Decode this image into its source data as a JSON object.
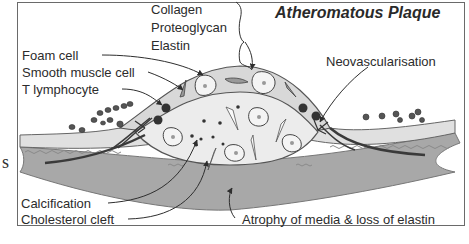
{
  "diagram": {
    "title": "Atheromatous Plaque",
    "side_fragment": "s",
    "labels": {
      "matrix": [
        "Collagen",
        "Proteoglycan",
        "Elastin"
      ],
      "cells": [
        "Foam cell",
        "Smooth muscle cell",
        "T lymphocyte"
      ],
      "neovascularisation": "Neovascularisation",
      "core": [
        "Calcification",
        "Cholesterol cleft"
      ],
      "media": "Atrophy of media & loss of elastin"
    },
    "colors": {
      "frame": "#6a6a6a",
      "fibrous_cap": "#dcdcdc",
      "lipid_core": "#ececec",
      "intima_band": "#e0e0e0",
      "media": "#a8a8a8",
      "lymphocyte": "#333333",
      "elastic_lamina": "#8a8a8a",
      "smooth_muscle_fibre": "#3a3a3a",
      "arrows": "#2e2e2e"
    }
  }
}
